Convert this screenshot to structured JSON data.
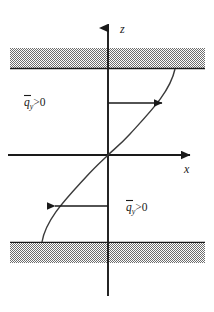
{
  "figure": {
    "name": "shear-flux-profile-diagram",
    "background_color": "#ffffff",
    "line_color": "#1a1a1a",
    "hatch_color": "#8c8c8c",
    "width": 214,
    "height": 312
  },
  "axes": {
    "vertical": {
      "label": "z",
      "icon": "up-arrow-icon",
      "x": 108,
      "top": 20,
      "bottom": 296,
      "label_x": 120,
      "label_y": 33
    },
    "horizontal": {
      "label": "x",
      "icon": "right-arrow-icon",
      "y": 155,
      "left": 8,
      "right": 197,
      "label_x": 184,
      "label_y": 173
    },
    "origin": {
      "x": 108,
      "y": 155
    }
  },
  "walls": {
    "top": {
      "name": "top-wall",
      "hatch_top": 48,
      "hatch_bottom": 68,
      "left": 10,
      "right": 205,
      "boundary_line_y": 68
    },
    "bottom": {
      "name": "bottom-wall",
      "hatch_top": 243,
      "hatch_bottom": 263,
      "left": 10,
      "right": 205,
      "boundary_line_y": 243
    }
  },
  "curve": {
    "name": "velocity-profile-curve",
    "description": "antisymmetric S-shaped profile through origin",
    "upper_endpoint": {
      "x": 175,
      "y": 69
    },
    "lower_endpoint": {
      "x": 42,
      "y": 242
    }
  },
  "arrows": [
    {
      "name": "upper-flux-arrow",
      "direction": "right",
      "y": 103,
      "from_x": 108,
      "to_x": 162
    },
    {
      "name": "lower-flux-arrow",
      "direction": "left",
      "y": 206,
      "from_x": 108,
      "to_x": 55
    }
  ],
  "labels": {
    "upper_flux": {
      "symbol": "q",
      "subscript": "y",
      "relation": ">0",
      "overbar": true,
      "x": 24,
      "y": 106
    },
    "lower_flux": {
      "symbol": "q",
      "subscript": "y",
      "relation": ">0",
      "overbar": true,
      "x": 126,
      "y": 211
    }
  }
}
